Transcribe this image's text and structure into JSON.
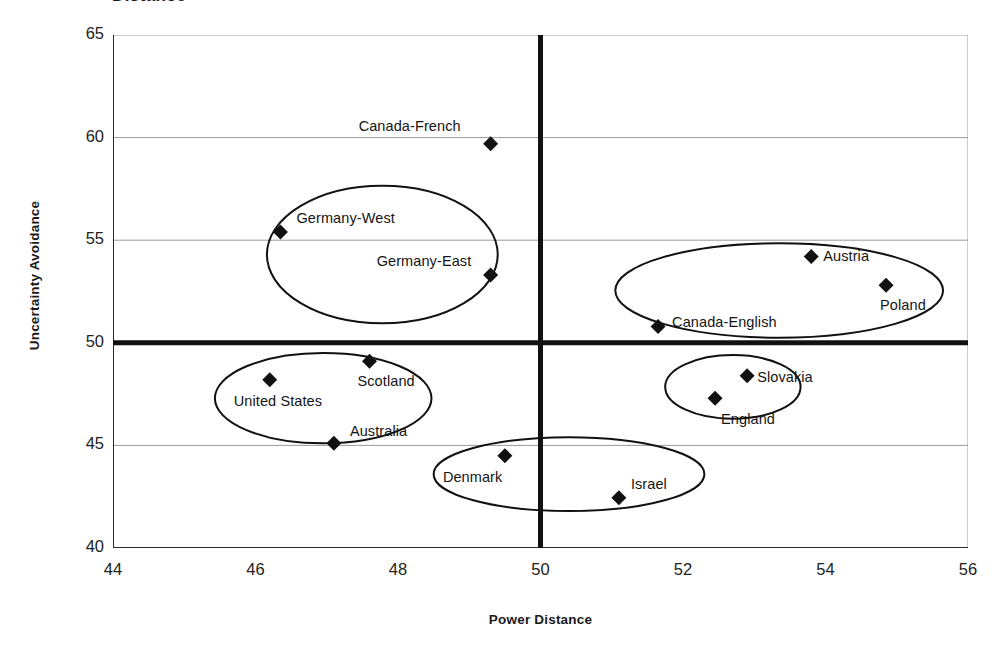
{
  "chart_data": {
    "type": "scatter",
    "title": "Distance",
    "xlabel": "Power Distance",
    "ylabel": "Uncertainty Avoidance",
    "xlim": [
      44,
      56
    ],
    "ylim": [
      40,
      65
    ],
    "xticks": [
      44,
      46,
      48,
      50,
      52,
      54,
      56
    ],
    "yticks": [
      40,
      45,
      50,
      55,
      60,
      65
    ],
    "grid": "horizontal",
    "legend": "none",
    "marker": "filled-diamond",
    "reference_lines": {
      "x": 50,
      "y": 50
    },
    "points": [
      {
        "label": "Canada-French",
        "x": 49.3,
        "y": 59.7,
        "label_dx": -132,
        "label_dy": -26
      },
      {
        "label": "Germany-West",
        "x": 46.35,
        "y": 55.4,
        "label_dx": 16,
        "label_dy": -22
      },
      {
        "label": "Germany-East",
        "x": 49.3,
        "y": 53.3,
        "label_dx": -114,
        "label_dy": -22
      },
      {
        "label": "Austria",
        "x": 53.8,
        "y": 54.2,
        "label_dx": 12,
        "label_dy": -9
      },
      {
        "label": "Poland",
        "x": 54.85,
        "y": 52.8,
        "label_dx": -6,
        "label_dy": 12
      },
      {
        "label": "Canada-English",
        "x": 51.65,
        "y": 50.8,
        "label_dx": 14,
        "label_dy": -12
      },
      {
        "label": "Scotland",
        "x": 47.6,
        "y": 49.1,
        "label_dx": -12,
        "label_dy": 12
      },
      {
        "label": "United States",
        "x": 46.2,
        "y": 48.2,
        "label_dx": -36,
        "label_dy": 13
      },
      {
        "label": "Slovakia",
        "x": 52.9,
        "y": 48.4,
        "label_dx": 10,
        "label_dy": -7
      },
      {
        "label": "England",
        "x": 52.45,
        "y": 47.3,
        "label_dx": 6,
        "label_dy": 13
      },
      {
        "label": "Australia",
        "x": 47.1,
        "y": 45.1,
        "label_dx": 16,
        "label_dy": -20
      },
      {
        "label": "Denmark",
        "x": 49.5,
        "y": 44.5,
        "label_dx": -62,
        "label_dy": 13
      },
      {
        "label": "Israel",
        "x": 51.1,
        "y": 42.45,
        "label_dx": 12,
        "label_dy": -22
      }
    ],
    "clusters": [
      {
        "name": "germany-cluster",
        "cx": 47.78,
        "cy": 54.3,
        "rx": 1.62,
        "ry": 3.35
      },
      {
        "name": "austria-poland-cluster",
        "cx": 53.35,
        "cy": 52.55,
        "rx": 2.3,
        "ry": 2.3
      },
      {
        "name": "anglo-cluster",
        "cx": 46.95,
        "cy": 47.3,
        "rx": 1.52,
        "ry": 2.2
      },
      {
        "name": "slovakia-england-cluster",
        "cx": 52.7,
        "cy": 47.85,
        "rx": 0.95,
        "ry": 1.55
      },
      {
        "name": "denmark-israel-cluster",
        "cx": 50.4,
        "cy": 43.6,
        "rx": 1.9,
        "ry": 1.8
      }
    ],
    "colors": {
      "marker": "#111111",
      "axis": "#2b2b2b",
      "gridline": "#9a9a9a",
      "reference_line": "#111111",
      "background": "#ffffff"
    }
  }
}
